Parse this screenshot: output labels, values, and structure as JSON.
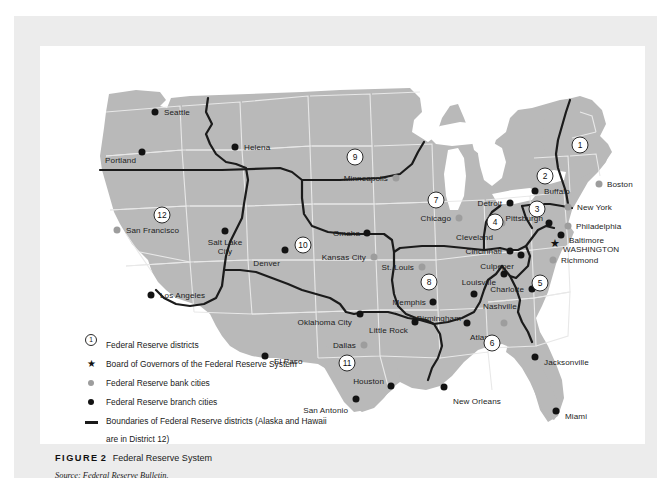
{
  "figure": {
    "label": "FIGURE",
    "number": "2",
    "title": "Federal Reserve System",
    "source_prefix": "Source:",
    "source_text": "Federal Reserve Bulletin."
  },
  "colors": {
    "land": "#b9b9b9",
    "state_border": "#e8e8e8",
    "district_border": "#1b1b1b",
    "branch_dot": "#131313",
    "bank_dot": "#9d9d9d",
    "panel": "#ececec",
    "map_background": "#ffffff"
  },
  "legend": {
    "items": [
      {
        "symbol": "district-number-circle",
        "glyph": "1",
        "text": "Federal Reserve districts"
      },
      {
        "symbol": "star",
        "glyph": "★",
        "text": "Board of Governors of the Federal Reserve System"
      },
      {
        "symbol": "gray-dot",
        "glyph": "",
        "text": "Federal Reserve bank cities"
      },
      {
        "symbol": "black-dot",
        "glyph": "",
        "text": "Federal Reserve branch cities"
      },
      {
        "symbol": "line",
        "glyph": "",
        "text": "Boundaries of Federal Reserve districts (Alaska and Hawaii are in District 12)"
      }
    ]
  },
  "map": {
    "districts": [
      {
        "number": "1",
        "x": 540,
        "y": 99
      },
      {
        "number": "2",
        "x": 505,
        "y": 130
      },
      {
        "number": "3",
        "x": 497,
        "y": 163
      },
      {
        "number": "4",
        "x": 455,
        "y": 176
      },
      {
        "number": "5",
        "x": 500,
        "y": 237
      },
      {
        "number": "6",
        "x": 452,
        "y": 297
      },
      {
        "number": "7",
        "x": 396,
        "y": 154
      },
      {
        "number": "8",
        "x": 389,
        "y": 236
      },
      {
        "number": "9",
        "x": 315,
        "y": 111
      },
      {
        "number": "10",
        "x": 263,
        "y": 199
      },
      {
        "number": "11",
        "x": 307,
        "y": 317
      },
      {
        "number": "12",
        "x": 122,
        "y": 169
      }
    ],
    "bank_cities": [
      {
        "name": "San Francisco",
        "x": 77,
        "y": 184,
        "lx": 86,
        "ly": 180,
        "align": "left"
      },
      {
        "name": "Minneapolis",
        "x": 356,
        "y": 132,
        "lx": 348,
        "ly": 128,
        "align": "right"
      },
      {
        "name": "Kansas City",
        "x": 334,
        "y": 211,
        "lx": 326,
        "ly": 207,
        "align": "right"
      },
      {
        "name": "Chicago",
        "x": 419,
        "y": 172,
        "lx": 411,
        "ly": 168,
        "align": "right"
      },
      {
        "name": "St. Louis",
        "x": 382,
        "y": 221,
        "lx": 374,
        "ly": 217,
        "align": "right"
      },
      {
        "name": "Cleveland",
        "x": 462,
        "y": 177,
        "lx": 453,
        "ly": 187,
        "align": "right"
      },
      {
        "name": "Atlanta",
        "x": 464,
        "y": 277,
        "lx": 456,
        "ly": 287,
        "align": "right"
      },
      {
        "name": "Dallas",
        "x": 324,
        "y": 299,
        "lx": 316,
        "ly": 295,
        "align": "right"
      },
      {
        "name": "Richmond",
        "x": 513,
        "y": 214,
        "lx": 521,
        "ly": 210,
        "align": "left"
      },
      {
        "name": "Philadelphia",
        "x": 528,
        "y": 180,
        "lx": 536,
        "ly": 176,
        "align": "left"
      },
      {
        "name": "New York",
        "x": 528,
        "y": 161,
        "lx": 537,
        "ly": 157,
        "align": "left"
      },
      {
        "name": "Boston",
        "x": 559,
        "y": 138,
        "lx": 567,
        "ly": 134,
        "align": "left"
      }
    ],
    "branch_cities": [
      {
        "name": "Seattle",
        "x": 115,
        "y": 66,
        "lx": 124,
        "ly": 62,
        "align": "left"
      },
      {
        "name": "Portland",
        "x": 102,
        "y": 106,
        "lx": 96,
        "ly": 110,
        "align": "right"
      },
      {
        "name": "Helena",
        "x": 195,
        "y": 101,
        "lx": 204,
        "ly": 97,
        "align": "left"
      },
      {
        "name": "Salt Lake City",
        "x": 185,
        "y": 185,
        "lx": 185,
        "ly": 192,
        "align": "center"
      },
      {
        "name": "Denver",
        "x": 245,
        "y": 204,
        "lx": 240,
        "ly": 213,
        "align": "right"
      },
      {
        "name": "Los Angeles",
        "x": 111,
        "y": 249,
        "lx": 120,
        "ly": 245,
        "align": "left"
      },
      {
        "name": "Omaha",
        "x": 327,
        "y": 187,
        "lx": 320,
        "ly": 183,
        "align": "right"
      },
      {
        "name": "Oklahoma City",
        "x": 320,
        "y": 268,
        "lx": 312,
        "ly": 272,
        "align": "right"
      },
      {
        "name": "Little Rock",
        "x": 375,
        "y": 276,
        "lx": 368,
        "ly": 280,
        "align": "right"
      },
      {
        "name": "Memphis",
        "x": 393,
        "y": 256,
        "lx": 386,
        "ly": 252,
        "align": "right"
      },
      {
        "name": "Nashville",
        "x": 434,
        "y": 248,
        "lx": 443,
        "ly": 256,
        "align": "left"
      },
      {
        "name": "Birmingham",
        "x": 427,
        "y": 277,
        "lx": 421,
        "ly": 268,
        "align": "right"
      },
      {
        "name": "New Orleans",
        "x": 404,
        "y": 341,
        "lx": 413,
        "ly": 351,
        "align": "left"
      },
      {
        "name": "Houston",
        "x": 351,
        "y": 340,
        "lx": 344,
        "ly": 331,
        "align": "right"
      },
      {
        "name": "San Antonio",
        "x": 316,
        "y": 353,
        "lx": 308,
        "ly": 360,
        "align": "right"
      },
      {
        "name": "El Paso",
        "x": 225,
        "y": 310,
        "lx": 234,
        "ly": 311,
        "align": "left"
      },
      {
        "name": "Detroit",
        "x": 470,
        "y": 157,
        "lx": 462,
        "ly": 153,
        "align": "right"
      },
      {
        "name": "Cincinnati",
        "x": 470,
        "y": 205,
        "lx": 462,
        "ly": 201,
        "align": "right"
      },
      {
        "name": "Louisville",
        "x": 464,
        "y": 228,
        "lx": 456,
        "ly": 232,
        "align": "right"
      },
      {
        "name": "Pittsburgh",
        "x": 509,
        "y": 177,
        "lx": 503,
        "ly": 168,
        "align": "right"
      },
      {
        "name": "Buffalo",
        "x": 495,
        "y": 145,
        "lx": 504,
        "ly": 141,
        "align": "left"
      },
      {
        "name": "Baltimore",
        "x": 521,
        "y": 189,
        "lx": 529,
        "ly": 190,
        "align": "left"
      },
      {
        "name": "Culpeper",
        "x": 481,
        "y": 209,
        "lx": 474,
        "ly": 216,
        "align": "right"
      },
      {
        "name": "Charlotte",
        "x": 492,
        "y": 243,
        "lx": 484,
        "ly": 239,
        "align": "right"
      },
      {
        "name": "Jacksonville",
        "x": 495,
        "y": 311,
        "lx": 504,
        "ly": 312,
        "align": "left"
      },
      {
        "name": "Miami",
        "x": 516,
        "y": 365,
        "lx": 525,
        "ly": 366,
        "align": "left"
      }
    ],
    "board_of_governors": {
      "name": "WASHINGTON",
      "x": 515,
      "y": 197,
      "lx": 523,
      "ly": 199
    }
  }
}
